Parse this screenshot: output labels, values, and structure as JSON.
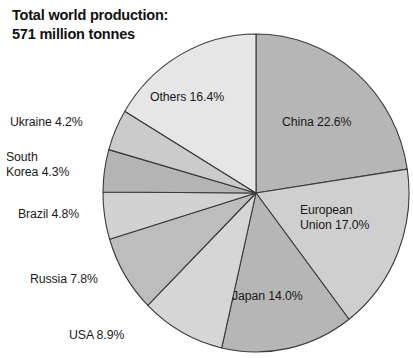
{
  "title": "Total world production:\n571 million tonnes",
  "chart_data": {
    "type": "pie",
    "title": "Total world production: 571 million tonnes",
    "total_label": "571 million tonnes",
    "total_value": 571,
    "units": "million tonnes",
    "xlabel": "",
    "ylabel": "",
    "legend_position": "none",
    "grid": false,
    "start_angle_deg": 0,
    "direction": "clockwise",
    "categories": [
      "China",
      "European Union",
      "Japan",
      "USA",
      "Russia",
      "Brazil",
      "South Korea",
      "Ukraine",
      "Others"
    ],
    "values": [
      22.6,
      17.0,
      14.0,
      8.9,
      7.8,
      4.8,
      4.3,
      4.2,
      16.4
    ],
    "value_unit": "%",
    "slices": [
      {
        "name": "China",
        "value": 22.6,
        "label": "China 22.6%",
        "label_placement": "inside",
        "color": "#b6b6b6"
      },
      {
        "name": "European Union",
        "value": 17.0,
        "label": "European\nUnion 17.0%",
        "label_placement": "inside",
        "color": "#cfcfcf"
      },
      {
        "name": "Japan",
        "value": 14.0,
        "label": "Japan 14.0%",
        "label_placement": "inside",
        "color": "#b6b6b6"
      },
      {
        "name": "USA",
        "value": 8.9,
        "label": "USA 8.9%",
        "label_placement": "outside",
        "color": "#d6d6d6"
      },
      {
        "name": "Russia",
        "value": 7.8,
        "label": "Russia 7.8%",
        "label_placement": "outside",
        "color": "#bdbdbd"
      },
      {
        "name": "Brazil",
        "value": 4.8,
        "label": "Brazil 4.8%",
        "label_placement": "outside",
        "color": "#d2d2d2"
      },
      {
        "name": "South Korea",
        "value": 4.3,
        "label": "South\nKorea 4.3%",
        "label_placement": "outside",
        "color": "#b4b4b4"
      },
      {
        "name": "Ukraine",
        "value": 4.2,
        "label": "Ukraine 4.2%",
        "label_placement": "outside",
        "color": "#cbcbcb"
      },
      {
        "name": "Others",
        "value": 16.4,
        "label": "Others 16.4%",
        "label_placement": "inside",
        "color": "#e6e6e6"
      }
    ],
    "geometry": {
      "cx": 256,
      "cy": 193,
      "rx": 153,
      "ry": 159
    },
    "stroke_color": "#3a3a3a",
    "background": "#ffffff"
  }
}
